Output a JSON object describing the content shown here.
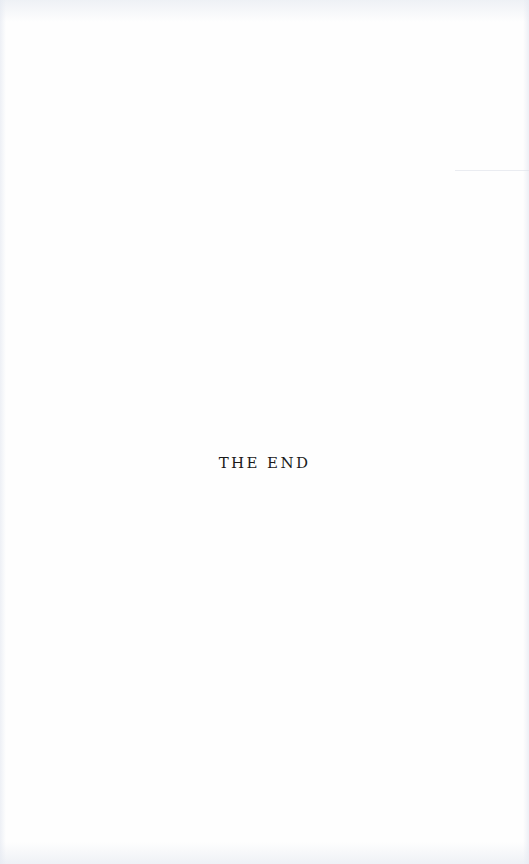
{
  "page": {
    "closing_text": "THE END",
    "background_color": "#fefefe",
    "text_color": "#1a1a1a"
  }
}
